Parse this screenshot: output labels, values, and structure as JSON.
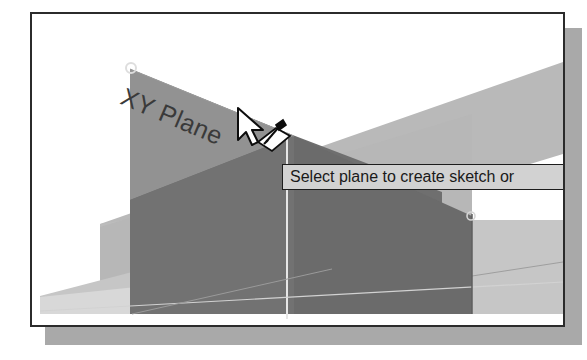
{
  "window": {
    "name": "cad-3d-viewport-window",
    "border_color": "#2b2b2b",
    "background_color": "#ffffff",
    "shadow_color": "#a9a9a9"
  },
  "viewport": {
    "label": "XY Plane",
    "label_color": "#3a3a3a",
    "highlighted_plane_color": "#767676",
    "background_plane_color": "#b4b4b4",
    "ground_plane_color": "#c9c9c9",
    "axis_line_color": "#e8e8e8",
    "vertex_marker_name": "plane-corner-vertex"
  },
  "cursor": {
    "name": "arrow-select-plane-cursor",
    "arrow_fill": "#ffffff",
    "arrow_stroke": "#000000",
    "glyph_name": "select-plane-glyph"
  },
  "tooltip": {
    "text": "Select plane to create sketch or",
    "background_color": "#d2d2d2",
    "border_color": "#1d1d1d",
    "text_color": "#1a1a1a"
  }
}
